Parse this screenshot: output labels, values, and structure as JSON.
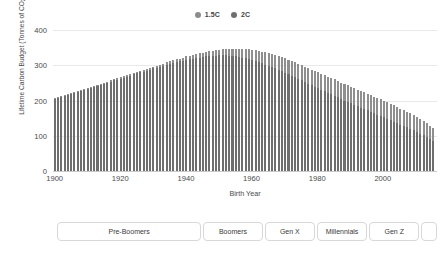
{
  "legend": {
    "position": "top-center",
    "items": [
      {
        "label": "1.5C",
        "color": "#8c8c8c"
      },
      {
        "label": "2C",
        "color": "#6f6f6f"
      }
    ]
  },
  "axes": {
    "y_title": "Lifetime Carbon Budget (Tonnes of CO",
    "y_title_sub": "2",
    "y_title_end": ")",
    "y_ticks": [
      "0",
      "100",
      "200",
      "300",
      "400"
    ],
    "x_title": "Birth Year",
    "x_ticks": [
      "1900",
      "1920",
      "1940",
      "1960",
      "1980",
      "2000"
    ]
  },
  "generations": {
    "items": [
      {
        "label": "Pre-Boomers",
        "start_year": 1900,
        "end_year": 1945
      },
      {
        "label": "Boomers",
        "start_year": 1946,
        "end_year": 1964
      },
      {
        "label": "Gen X",
        "start_year": 1965,
        "end_year": 1980
      },
      {
        "label": "Millennials",
        "start_year": 1981,
        "end_year": 1996
      },
      {
        "label": "Gen Z",
        "start_year": 1997,
        "end_year": 2012
      },
      {
        "label": "",
        "start_year": 2013,
        "end_year": 2017
      }
    ]
  },
  "chart_data": {
    "type": "bar",
    "title": "",
    "xlabel": "Birth Year",
    "ylabel": "Lifetime Carbon Budget (Tonnes of CO2)",
    "xlim": [
      1900,
      2017
    ],
    "ylim": [
      0,
      420
    ],
    "grid": true,
    "legend_position": "top-center",
    "overlap": "overlay",
    "x": [
      1900,
      1901,
      1902,
      1903,
      1904,
      1905,
      1906,
      1907,
      1908,
      1909,
      1910,
      1911,
      1912,
      1913,
      1914,
      1915,
      1916,
      1917,
      1918,
      1919,
      1920,
      1921,
      1922,
      1923,
      1924,
      1925,
      1926,
      1927,
      1928,
      1929,
      1930,
      1931,
      1932,
      1933,
      1934,
      1935,
      1936,
      1937,
      1938,
      1939,
      1940,
      1941,
      1942,
      1943,
      1944,
      1945,
      1946,
      1947,
      1948,
      1949,
      1950,
      1951,
      1952,
      1953,
      1954,
      1955,
      1956,
      1957,
      1958,
      1959,
      1960,
      1961,
      1962,
      1963,
      1964,
      1965,
      1966,
      1967,
      1968,
      1969,
      1970,
      1971,
      1972,
      1973,
      1974,
      1975,
      1976,
      1977,
      1978,
      1979,
      1980,
      1981,
      1982,
      1983,
      1984,
      1985,
      1986,
      1987,
      1988,
      1989,
      1990,
      1991,
      1992,
      1993,
      1994,
      1995,
      1996,
      1997,
      1998,
      1999,
      2000,
      2001,
      2002,
      2003,
      2004,
      2005,
      2006,
      2007,
      2008,
      2009,
      2010,
      2011,
      2012,
      2013,
      2014,
      2015
    ],
    "series": [
      {
        "name": "2C",
        "color": "#8f8f8f",
        "values": [
          206,
          209,
          212,
          215,
          218,
          221,
          224,
          227,
          230,
          233,
          236,
          239,
          242,
          245,
          248,
          251,
          254,
          257,
          260,
          263,
          266,
          269,
          272,
          275,
          278,
          281,
          284,
          287,
          290,
          293,
          296,
          299,
          302,
          305,
          308,
          311,
          314,
          317,
          319,
          322,
          325,
          327,
          330,
          332,
          334,
          336,
          338,
          340,
          341,
          343,
          344,
          345,
          346,
          346,
          347,
          347,
          347,
          346,
          346,
          345,
          344,
          343,
          341,
          339,
          337,
          335,
          332,
          329,
          326,
          323,
          320,
          316,
          312,
          308,
          304,
          300,
          296,
          292,
          288,
          284,
          280,
          276,
          272,
          268,
          264,
          260,
          256,
          251,
          247,
          243,
          239,
          235,
          231,
          227,
          223,
          219,
          215,
          211,
          207,
          203,
          199,
          195,
          190,
          186,
          182,
          177,
          173,
          168,
          164,
          159,
          154,
          148,
          142,
          136,
          129,
          121
        ]
      },
      {
        "name": "1.5C",
        "color": "#6e6e6e",
        "values": [
          203,
          206,
          209,
          212,
          215,
          218,
          221,
          224,
          227,
          230,
          233,
          236,
          239,
          242,
          245,
          248,
          251,
          254,
          257,
          259,
          262,
          265,
          268,
          271,
          274,
          277,
          280,
          282,
          285,
          288,
          291,
          293,
          296,
          299,
          301,
          304,
          306,
          309,
          311,
          313,
          315,
          317,
          319,
          321,
          322,
          324,
          325,
          326,
          327,
          327,
          328,
          328,
          328,
          327,
          326,
          325,
          324,
          322,
          320,
          318,
          315,
          312,
          309,
          306,
          302,
          299,
          295,
          291,
          287,
          283,
          279,
          275,
          270,
          266,
          262,
          257,
          253,
          248,
          244,
          239,
          235,
          231,
          226,
          222,
          218,
          213,
          209,
          205,
          200,
          196,
          192,
          188,
          184,
          180,
          176,
          172,
          168,
          164,
          160,
          156,
          152,
          148,
          144,
          140,
          136,
          132,
          128,
          124,
          119,
          115,
          111,
          106,
          101,
          96,
          90,
          84
        ]
      }
    ]
  }
}
